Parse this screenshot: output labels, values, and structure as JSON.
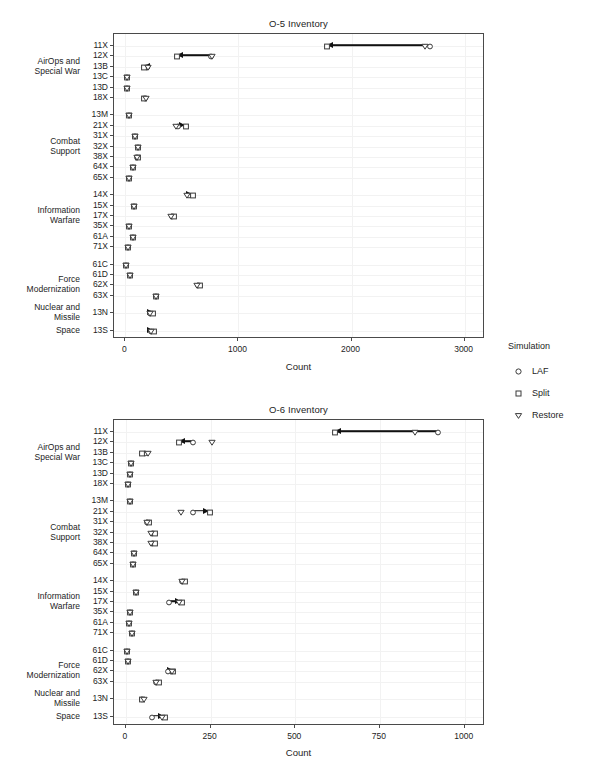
{
  "legend": {
    "title": "Simulation",
    "items": [
      {
        "label": "LAF",
        "shape": "circle-open-icon"
      },
      {
        "label": "Split",
        "shape": "square-open-icon"
      },
      {
        "label": "Restore",
        "shape": "triangle-down-open-icon"
      }
    ]
  },
  "group_labels": {
    "airops": "AirOps and\nSpecial War",
    "combat": "Combat\nSupport",
    "info": "Information\nWarfare",
    "force": "Force\nModernization",
    "nuclear": "Nuclear and\nMissile",
    "space": "Space"
  },
  "chart_data": [
    {
      "type": "scatter",
      "title": "O-5 Inventory",
      "xlabel": "Count",
      "ylabel": "",
      "xlim": [
        -100,
        3180
      ],
      "xticks": [
        0,
        1000,
        2000,
        3000
      ],
      "xticklabels": [
        "0",
        "1000",
        "2000",
        "3000"
      ],
      "grid": true,
      "legend_position": "right",
      "categories": [
        "11X",
        "12X",
        "13B",
        "13C",
        "13D",
        "18X",
        "13M",
        "21X",
        "31X",
        "32X",
        "38X",
        "64X",
        "65X",
        "14X",
        "15X",
        "17X",
        "35X",
        "61A",
        "71X",
        "61C",
        "61D",
        "62X",
        "63X",
        "13N",
        "13S"
      ],
      "series": [
        {
          "name": "LAF",
          "values": [
            2700,
            770,
            200,
            25,
            20,
            180,
            45,
            475,
            95,
            125,
            110,
            75,
            45,
            570,
            85,
            420,
            40,
            75,
            35,
            15,
            50,
            650,
            280,
            230,
            240
          ]
        },
        {
          "name": "Split",
          "values": [
            1790,
            465,
            170,
            25,
            20,
            175,
            45,
            545,
            95,
            125,
            120,
            75,
            45,
            605,
            85,
            440,
            40,
            75,
            35,
            15,
            50,
            665,
            280,
            255,
            260
          ]
        },
        {
          "name": "Restore",
          "values": [
            2660,
            775,
            210,
            25,
            20,
            190,
            45,
            460,
            95,
            125,
            110,
            75,
            45,
            555,
            85,
            415,
            40,
            75,
            35,
            15,
            50,
            640,
            280,
            225,
            235
          ]
        }
      ],
      "annotations": [
        {
          "category": "11X",
          "from": 2660,
          "to": 1790,
          "direction": "left"
        },
        {
          "category": "12X",
          "from": 775,
          "to": 465,
          "direction": "left"
        },
        {
          "category": "13B",
          "from": 210,
          "to": 170,
          "direction": "left"
        },
        {
          "category": "21X",
          "from": 460,
          "to": 545,
          "direction": "right"
        },
        {
          "category": "14X",
          "from": 555,
          "to": 605,
          "direction": "right"
        },
        {
          "category": "13N",
          "from": 225,
          "to": 255,
          "direction": "right"
        },
        {
          "category": "13S",
          "from": 235,
          "to": 260,
          "direction": "right"
        }
      ]
    },
    {
      "type": "scatter",
      "title": "O-6 Inventory",
      "xlabel": "Count",
      "ylabel": "",
      "xlim": [
        -35,
        1060
      ],
      "xticks": [
        0,
        250,
        500,
        750,
        1000
      ],
      "xticklabels": [
        "0",
        "250",
        "500",
        "750",
        "1000"
      ],
      "grid": true,
      "legend_position": "right",
      "categories": [
        "11X",
        "12X",
        "13B",
        "13C",
        "13D",
        "18X",
        "13M",
        "21X",
        "31X",
        "32X",
        "38X",
        "64X",
        "65X",
        "14X",
        "15X",
        "17X",
        "35X",
        "61A",
        "71X",
        "61C",
        "61D",
        "62X",
        "63X",
        "13N",
        "13S"
      ],
      "series": [
        {
          "name": "LAF",
          "values": [
            925,
            200,
            60,
            18,
            14,
            10,
            14,
            200,
            65,
            80,
            80,
            28,
            24,
            170,
            32,
            130,
            16,
            12,
            20,
            5,
            10,
            128,
            92,
            50,
            80
          ]
        },
        {
          "name": "Split",
          "values": [
            620,
            160,
            52,
            18,
            14,
            10,
            14,
            250,
            72,
            88,
            88,
            28,
            24,
            178,
            32,
            168,
            16,
            12,
            20,
            5,
            10,
            143,
            100,
            50,
            118
          ]
        },
        {
          "name": "Restore",
          "values": [
            855,
            258,
            68,
            18,
            14,
            10,
            14,
            165,
            65,
            78,
            78,
            28,
            24,
            170,
            32,
            160,
            16,
            12,
            20,
            5,
            10,
            140,
            92,
            56,
            110
          ]
        }
      ],
      "annotations": [
        {
          "category": "11X",
          "from": 925,
          "to": 620,
          "direction": "left"
        },
        {
          "category": "12X",
          "from": 200,
          "to": 160,
          "direction": "left"
        },
        {
          "category": "21X",
          "from": 200,
          "to": 250,
          "direction": "right"
        },
        {
          "category": "17X",
          "from": 130,
          "to": 168,
          "direction": "right"
        },
        {
          "category": "62X",
          "from": 128,
          "to": 143,
          "direction": "right"
        },
        {
          "category": "13S",
          "from": 80,
          "to": 118,
          "direction": "right"
        }
      ]
    }
  ]
}
